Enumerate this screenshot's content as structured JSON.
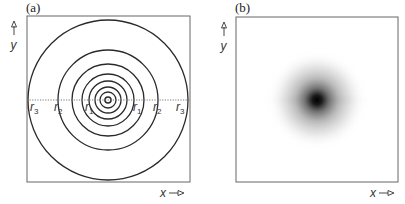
{
  "panels": [
    {
      "id": "a",
      "label": "(a)",
      "y_axis_label": "y",
      "x_axis_label": "x",
      "description": "Concentric circles centered on a dotted horizontal diameter",
      "ring_count": 8,
      "radius_labels": [
        {
          "symbol": "r",
          "sub": "3"
        },
        {
          "symbol": "r",
          "sub": "2"
        },
        {
          "symbol": "r",
          "sub": "1"
        },
        {
          "symbol": "r",
          "sub": "1"
        },
        {
          "symbol": "r",
          "sub": "2"
        },
        {
          "symbol": "r",
          "sub": "3"
        }
      ],
      "line_color": "#2a2a2a"
    },
    {
      "id": "b",
      "label": "(b)",
      "y_axis_label": "y",
      "x_axis_label": "x",
      "description": "Gaussian-like blurred spot, darkest at center",
      "spot_color": "#000000"
    }
  ]
}
